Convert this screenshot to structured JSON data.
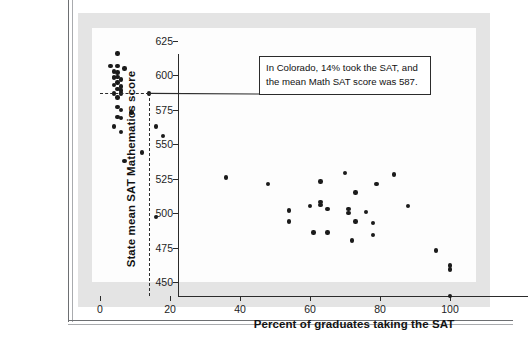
{
  "figure": {
    "ghost_text_top": "",
    "ghost_text_mid": ""
  },
  "annotation": {
    "line1": "In Colorado, 14% took the SAT, and",
    "line2": "the mean Math SAT score was 587.",
    "target_x": 14,
    "target_y": 587
  },
  "chart_data": {
    "type": "scatter",
    "title": "",
    "xlabel": "Percent of graduates taking the SAT",
    "ylabel": "State mean SAT Mathematics score",
    "xlim": [
      -4,
      108
    ],
    "ylim": [
      437,
      629
    ],
    "xticks": [
      0,
      20,
      40,
      60,
      80,
      100
    ],
    "yticks": [
      450,
      475,
      500,
      525,
      550,
      575,
      600,
      625
    ],
    "grid": false,
    "legend": null,
    "marker_color": "#1b1b1b",
    "points": [
      {
        "x": 5,
        "y": 616
      },
      {
        "x": 3,
        "y": 607
      },
      {
        "x": 5,
        "y": 607
      },
      {
        "x": 7,
        "y": 605
      },
      {
        "x": 4,
        "y": 603
      },
      {
        "x": 5,
        "y": 602
      },
      {
        "x": 4,
        "y": 599
      },
      {
        "x": 5,
        "y": 599
      },
      {
        "x": 4,
        "y": 598
      },
      {
        "x": 6,
        "y": 597
      },
      {
        "x": 5,
        "y": 595
      },
      {
        "x": 4,
        "y": 593
      },
      {
        "x": 6,
        "y": 592
      },
      {
        "x": 5,
        "y": 590
      },
      {
        "x": 6,
        "y": 589
      },
      {
        "x": 4,
        "y": 587
      },
      {
        "x": 6,
        "y": 587
      },
      {
        "x": 14,
        "y": 587,
        "label": "Colorado",
        "highlight": true
      },
      {
        "x": 5,
        "y": 584
      },
      {
        "x": 5,
        "y": 577
      },
      {
        "x": 6,
        "y": 575
      },
      {
        "x": 9,
        "y": 573
      },
      {
        "x": 5,
        "y": 570
      },
      {
        "x": 6,
        "y": 569
      },
      {
        "x": 4,
        "y": 563
      },
      {
        "x": 16,
        "y": 563
      },
      {
        "x": 6,
        "y": 559
      },
      {
        "x": 18,
        "y": 556
      },
      {
        "x": 12,
        "y": 544
      },
      {
        "x": 7,
        "y": 538
      },
      {
        "x": 16,
        "y": 497
      },
      {
        "x": 36,
        "y": 526
      },
      {
        "x": 48,
        "y": 521
      },
      {
        "x": 54,
        "y": 502
      },
      {
        "x": 54,
        "y": 494
      },
      {
        "x": 60,
        "y": 505
      },
      {
        "x": 63,
        "y": 523
      },
      {
        "x": 63,
        "y": 508
      },
      {
        "x": 63,
        "y": 506
      },
      {
        "x": 61,
        "y": 486
      },
      {
        "x": 65,
        "y": 503
      },
      {
        "x": 65,
        "y": 486
      },
      {
        "x": 70,
        "y": 529
      },
      {
        "x": 71,
        "y": 503
      },
      {
        "x": 71,
        "y": 500
      },
      {
        "x": 72,
        "y": 480
      },
      {
        "x": 73,
        "y": 515
      },
      {
        "x": 73,
        "y": 494
      },
      {
        "x": 76,
        "y": 501
      },
      {
        "x": 78,
        "y": 493
      },
      {
        "x": 78,
        "y": 484
      },
      {
        "x": 79,
        "y": 521
      },
      {
        "x": 84,
        "y": 528
      },
      {
        "x": 88,
        "y": 505
      },
      {
        "x": 96,
        "y": 473
      },
      {
        "x": 100,
        "y": 462
      },
      {
        "x": 100,
        "y": 459
      },
      {
        "x": 100,
        "y": 440
      }
    ]
  }
}
